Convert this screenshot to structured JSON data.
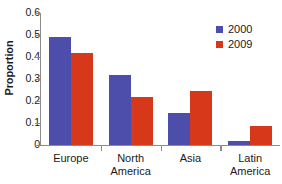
{
  "chart_data": {
    "type": "bar",
    "title": "",
    "xlabel": "",
    "ylabel": "Proportion",
    "ylim": [
      0,
      0.6
    ],
    "yticks": [
      "0",
      "0.1",
      "0.2",
      "0.3",
      "0.4",
      "0.5",
      "0.6"
    ],
    "ytick_values": [
      0,
      0.1,
      0.2,
      0.3,
      0.4,
      0.5,
      0.6
    ],
    "grid": false,
    "legend_position": "top-right",
    "categories": [
      "Europe",
      "North America",
      "Asia",
      "Latin America"
    ],
    "category_lines": [
      {
        "line1": "Europe",
        "line2": ""
      },
      {
        "line1": "North",
        "line2": "America"
      },
      {
        "line1": "Asia",
        "line2": ""
      },
      {
        "line1": "Latin",
        "line2": "America"
      }
    ],
    "series": [
      {
        "name": "2000",
        "color": "#4d4dab",
        "values": [
          0.49,
          0.32,
          0.145,
          0.02
        ]
      },
      {
        "name": "2009",
        "color": "#d8381a",
        "values": [
          0.42,
          0.22,
          0.245,
          0.085
        ]
      }
    ]
  },
  "legend": {
    "entries": [
      {
        "label": "2000",
        "color": "#4d4dab"
      },
      {
        "label": "2009",
        "color": "#d8381a"
      }
    ]
  },
  "axes": {
    "y_title": "Proportion"
  }
}
